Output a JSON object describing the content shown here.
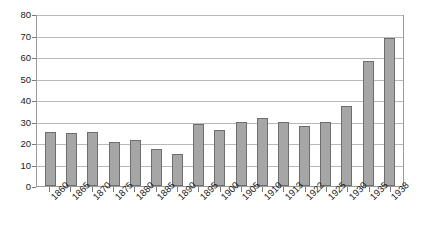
{
  "chart_data": {
    "type": "bar",
    "title": "",
    "subtitle": "",
    "xlabel": "",
    "ylabel": "",
    "categories": [
      "1860",
      "1865",
      "1870",
      "1875",
      "1880",
      "1885",
      "1890",
      "1895",
      "1900",
      "1905",
      "1910",
      "1913",
      "1922",
      "1925",
      "1930",
      "1935",
      "1938"
    ],
    "values": [
      25,
      24.5,
      25,
      20.5,
      21.5,
      17,
      15,
      29,
      26,
      30,
      31.5,
      30,
      28,
      30,
      37,
      58,
      69
    ],
    "series": [
      {
        "name": "",
        "values": [
          25,
          24.5,
          25,
          20.5,
          21.5,
          17,
          15,
          29,
          26,
          30,
          31.5,
          30,
          28,
          30,
          37,
          58,
          69
        ]
      }
    ],
    "ylim": [
      0,
      80
    ],
    "ytick_values": [
      0,
      10,
      20,
      30,
      40,
      50,
      60,
      70,
      80
    ],
    "ytick_labels": [
      "0",
      "10",
      "20",
      "30",
      "40",
      "50",
      "60",
      "70",
      "80"
    ],
    "ytick_step": 10,
    "grid": true,
    "grid_axis": "y",
    "legend": false,
    "legend_position": "none",
    "annotations": [],
    "colors": {
      "bar_fill": "#a6a6a6",
      "bar_stroke": "#6e6e6e",
      "gridline": "#b9b9b9",
      "axis": "#9a9a9a",
      "text": "#1a1a1a",
      "background": "#ffffff"
    },
    "xlabel_rotation": -45
  }
}
